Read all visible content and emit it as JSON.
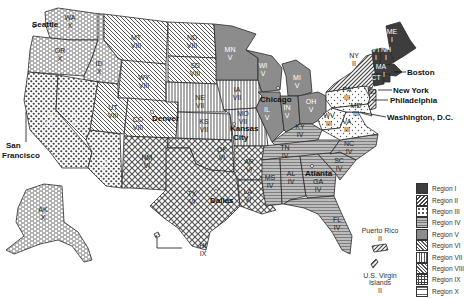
{
  "map": {
    "title": "",
    "type": "US federal regions map"
  },
  "regions": [
    {
      "id": "I",
      "label": "Region I",
      "pattern": "solid-dark",
      "color": "#3a3a3a"
    },
    {
      "id": "II",
      "label": "Region II",
      "pattern": "diagonal-forward",
      "color": "#555555"
    },
    {
      "id": "III",
      "label": "Region III",
      "pattern": "dots-light",
      "color": "#666666"
    },
    {
      "id": "IV",
      "label": "Region IV",
      "pattern": "horizontal-lines",
      "color": "#777777"
    },
    {
      "id": "V",
      "label": "Region V",
      "pattern": "solid-gray",
      "color": "#8a8a8a"
    },
    {
      "id": "VI",
      "label": "Region VI",
      "pattern": "crosshatch-diamond",
      "color": "#555555"
    },
    {
      "id": "VII",
      "label": "Region VII",
      "pattern": "vertical-lines",
      "color": "#555555"
    },
    {
      "id": "VIII",
      "label": "Region VIII",
      "pattern": "diagonal-back",
      "color": "#555555"
    },
    {
      "id": "IX",
      "label": "Region IX",
      "pattern": "dense-dots",
      "color": "#444444"
    },
    {
      "id": "X",
      "label": "Region X",
      "pattern": "brick-dashes",
      "color": "#555555"
    }
  ],
  "states": [
    {
      "abbr": "WA",
      "region": "X"
    },
    {
      "abbr": "OR",
      "region": "X"
    },
    {
      "abbr": "ID",
      "region": "X"
    },
    {
      "abbr": "AK",
      "region": "X"
    },
    {
      "abbr": "CA",
      "region": "IX"
    },
    {
      "abbr": "NV",
      "region": "IX"
    },
    {
      "abbr": "AZ",
      "region": "IX"
    },
    {
      "abbr": "HI",
      "region": "IX"
    },
    {
      "abbr": "MT",
      "region": "VIII"
    },
    {
      "abbr": "WY",
      "region": "VIII"
    },
    {
      "abbr": "UT",
      "region": "VIII"
    },
    {
      "abbr": "CO",
      "region": "VIII"
    },
    {
      "abbr": "ND",
      "region": "VIII"
    },
    {
      "abbr": "SD",
      "region": "VIII"
    },
    {
      "abbr": "NE",
      "region": "VII"
    },
    {
      "abbr": "KS",
      "region": "VII"
    },
    {
      "abbr": "IA",
      "region": "VII"
    },
    {
      "abbr": "MO",
      "region": "VII"
    },
    {
      "abbr": "NM",
      "region": "VI"
    },
    {
      "abbr": "TX",
      "region": "VI"
    },
    {
      "abbr": "OK",
      "region": "VI"
    },
    {
      "abbr": "AR",
      "region": "VI"
    },
    {
      "abbr": "LA",
      "region": "VI"
    },
    {
      "abbr": "MN",
      "region": "V"
    },
    {
      "abbr": "WI",
      "region": "V"
    },
    {
      "abbr": "MI",
      "region": "V"
    },
    {
      "abbr": "IL",
      "region": "V"
    },
    {
      "abbr": "IN",
      "region": "V"
    },
    {
      "abbr": "OH",
      "region": "V"
    },
    {
      "abbr": "KY",
      "region": "IV"
    },
    {
      "abbr": "TN",
      "region": "IV"
    },
    {
      "abbr": "MS",
      "region": "IV"
    },
    {
      "abbr": "AL",
      "region": "IV"
    },
    {
      "abbr": "GA",
      "region": "IV"
    },
    {
      "abbr": "FL",
      "region": "IV"
    },
    {
      "abbr": "SC",
      "region": "IV"
    },
    {
      "abbr": "NC",
      "region": "IV"
    },
    {
      "abbr": "PA",
      "region": "III"
    },
    {
      "abbr": "WV",
      "region": "III"
    },
    {
      "abbr": "VA",
      "region": "III"
    },
    {
      "abbr": "MD",
      "region": "III"
    },
    {
      "abbr": "DE",
      "region": "III"
    },
    {
      "abbr": "NY",
      "region": "II"
    },
    {
      "abbr": "NJ",
      "region": "II"
    },
    {
      "abbr": "ME",
      "region": "I"
    },
    {
      "abbr": "NH",
      "region": "I"
    },
    {
      "abbr": "VT",
      "region": "I"
    },
    {
      "abbr": "MA",
      "region": "I"
    },
    {
      "abbr": "CT",
      "region": "I"
    },
    {
      "abbr": "RI",
      "region": "I"
    }
  ],
  "cities": [
    {
      "name": "Seattle",
      "region": "X"
    },
    {
      "name": "San Francisco",
      "line1": "San",
      "line2": "Francisco",
      "region": "IX"
    },
    {
      "name": "Denver",
      "region": "VIII"
    },
    {
      "name": "Kansas City",
      "line1": "Kansas",
      "line2": "City",
      "region": "VII"
    },
    {
      "name": "Dallas",
      "region": "VI"
    },
    {
      "name": "Chicago",
      "region": "V"
    },
    {
      "name": "Atlanta",
      "region": "IV"
    },
    {
      "name": "Philadelphia",
      "region": "III"
    },
    {
      "name": "New York",
      "region": "II"
    },
    {
      "name": "Boston",
      "region": "I"
    },
    {
      "name": "Washington, D.C.",
      "region": "III"
    }
  ],
  "territories": [
    {
      "name": "Puerto Rico",
      "region": "II",
      "region_label": "II"
    },
    {
      "name": "U.S. Virgin Islands",
      "line1": "U.S. Virgin",
      "line2": "Islands",
      "region": "II",
      "region_label": "II"
    }
  ],
  "labels": {
    "WA": "WA",
    "X": "X",
    "OR": "OR",
    "ID": "ID",
    "AK": "AK",
    "CA": "CA",
    "NV": "NV",
    "AZ": "AZ",
    "HI": "HI",
    "IX": "IX",
    "MT": "MT",
    "WY": "WY",
    "UT": "UT",
    "CO": "CO",
    "ND": "ND",
    "SD": "SD",
    "VIII": "VIII",
    "NE": "NE",
    "KS": "KS",
    "IA": "IA",
    "MO": "MO",
    "VII": "VII",
    "NM": "NM",
    "TX": "TX",
    "OK": "OK",
    "AR": "AR",
    "LA": "LA",
    "VI": "VI",
    "MN": "MN",
    "WI": "WI",
    "MI": "MI",
    "IL": "IL",
    "IN": "IN",
    "OH": "OH",
    "V": "V",
    "KY": "KY",
    "TN": "TN",
    "MS": "MS",
    "AL": "AL",
    "GA": "GA",
    "FL": "FL",
    "SC": "SC",
    "NC": "NC",
    "IV": "IV",
    "PA": "PA",
    "WV": "WV",
    "VA": "VA",
    "MD": "MD",
    "III": "III",
    "NY": "NY",
    "NJ": "NJ",
    "II": "II",
    "ME": "ME",
    "NH": "NH",
    "VT": "VT",
    "MA": "MA",
    "CT": "CT",
    "I": "I"
  }
}
